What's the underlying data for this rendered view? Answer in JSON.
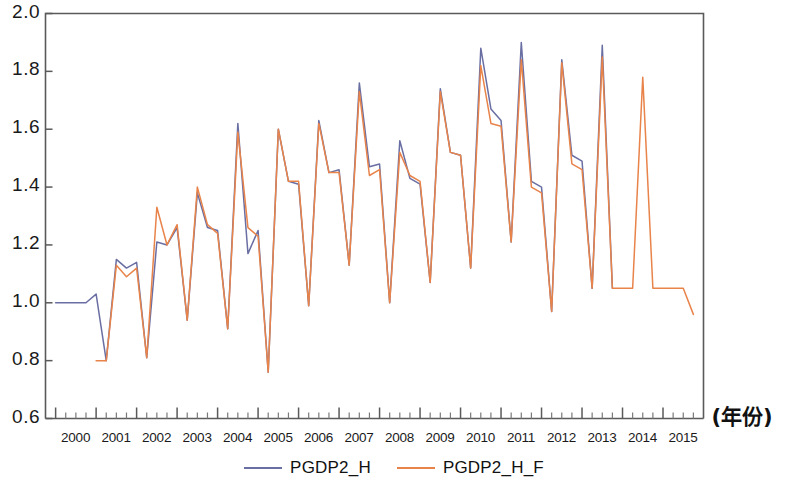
{
  "chart_data": {
    "type": "line",
    "title": "",
    "xlabel": "(年份)",
    "ylabel": "",
    "ylim": [
      0.6,
      2.0
    ],
    "ytick_labels": [
      "2.0",
      "1.8",
      "1.6",
      "1.4",
      "1.2",
      "1.0",
      "0.8",
      "0.6"
    ],
    "ytick_values": [
      2.0,
      1.8,
      1.6,
      1.4,
      1.2,
      1.0,
      0.8,
      0.6
    ],
    "xlim": [
      1999.75,
      2016.0
    ],
    "categories": [
      "2000Q1",
      "2000Q2",
      "2000Q3",
      "2000Q4",
      "2001Q1",
      "2001Q2",
      "2001Q3",
      "2001Q4",
      "2002Q1",
      "2002Q2",
      "2002Q3",
      "2002Q4",
      "2003Q1",
      "2003Q2",
      "2003Q3",
      "2003Q4",
      "2004Q1",
      "2004Q2",
      "2004Q3",
      "2004Q4",
      "2005Q1",
      "2005Q2",
      "2005Q3",
      "2005Q4",
      "2006Q1",
      "2006Q2",
      "2006Q3",
      "2006Q4",
      "2007Q1",
      "2007Q2",
      "2007Q3",
      "2007Q4",
      "2008Q1",
      "2008Q2",
      "2008Q3",
      "2008Q4",
      "2009Q1",
      "2009Q2",
      "2009Q3",
      "2009Q4",
      "2010Q1",
      "2010Q2",
      "2010Q3",
      "2010Q4",
      "2011Q1",
      "2011Q2",
      "2011Q3",
      "2011Q4",
      "2012Q1",
      "2012Q2",
      "2012Q3",
      "2012Q4",
      "2013Q1",
      "2013Q2",
      "2013Q3",
      "2013Q4",
      "2014Q1",
      "2014Q2",
      "2014Q3",
      "2014Q4",
      "2015Q1",
      "2015Q2",
      "2015Q3",
      "2015Q4"
    ],
    "xtick_labels": [
      "2000",
      "2001",
      "2002",
      "2003",
      "2004",
      "2005",
      "2006",
      "2007",
      "2008",
      "2009",
      "2010",
      "2011",
      "2012",
      "2013",
      "2014",
      "2015"
    ],
    "xtick_values": [
      2000,
      2001,
      2002,
      2003,
      2004,
      2005,
      2006,
      2007,
      2008,
      2009,
      2010,
      2011,
      2012,
      2013,
      2014,
      2015
    ],
    "minor_ticks_per_major": 4,
    "grid": false,
    "legend_position": "bottom-center",
    "series": [
      {
        "name": "PGDP2_H",
        "color": "#6a6fa3",
        "values": [
          1.0,
          1.0,
          1.0,
          1.0,
          1.03,
          0.8,
          1.15,
          1.12,
          1.14,
          0.81,
          1.21,
          1.2,
          1.26,
          0.94,
          1.38,
          1.26,
          1.25,
          0.91,
          1.62,
          1.17,
          1.25,
          0.76,
          1.6,
          1.42,
          1.41,
          0.99,
          1.63,
          1.45,
          1.46,
          1.13,
          1.76,
          1.47,
          1.48,
          1.0,
          1.56,
          1.43,
          1.41,
          1.07,
          1.74,
          1.52,
          1.51,
          1.12,
          1.88,
          1.67,
          1.63,
          1.21,
          1.9,
          1.42,
          1.4,
          0.97,
          1.84,
          1.51,
          1.49,
          1.05,
          1.89,
          1.05,
          null,
          null,
          null,
          null,
          null,
          null,
          null,
          null
        ]
      },
      {
        "name": "PGDP2_H_F",
        "color": "#e8834a",
        "values": [
          null,
          null,
          null,
          null,
          0.8,
          0.8,
          1.13,
          1.09,
          1.12,
          0.81,
          1.33,
          1.2,
          1.27,
          0.94,
          1.4,
          1.27,
          1.24,
          0.91,
          1.59,
          1.26,
          1.23,
          0.76,
          1.6,
          1.42,
          1.42,
          0.99,
          1.62,
          1.45,
          1.45,
          1.13,
          1.73,
          1.44,
          1.46,
          1.0,
          1.52,
          1.44,
          1.42,
          1.07,
          1.73,
          1.52,
          1.51,
          1.12,
          1.82,
          1.62,
          1.61,
          1.21,
          1.84,
          1.4,
          1.38,
          0.97,
          1.83,
          1.48,
          1.46,
          1.05,
          1.85,
          1.05,
          1.05,
          1.05,
          1.78,
          1.05,
          1.05,
          1.05,
          1.05,
          0.96
        ]
      }
    ]
  },
  "legend": {
    "entries": [
      {
        "label": "PGDP2_H",
        "color": "#6a6fa3"
      },
      {
        "label": "PGDP2_H_F",
        "color": "#e8834a"
      }
    ]
  },
  "axes": {
    "x_unit_label": "(年份)"
  }
}
